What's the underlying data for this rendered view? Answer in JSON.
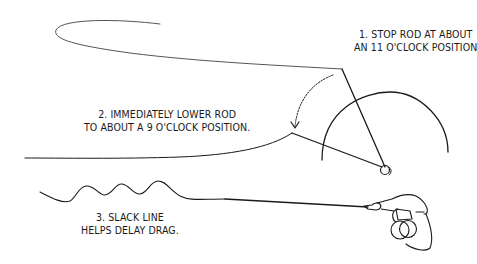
{
  "diagram": {
    "colors": {
      "ink": "#1a1a1a",
      "background": "#ffffff"
    },
    "steps": [
      {
        "number": "1.",
        "lines": [
          "1. STOP ROD AT ABOUT",
          "AN 11 O'CLOCK POSITION"
        ]
      },
      {
        "number": "2.",
        "lines": [
          "2. IMMEDIATELY LOWER ROD",
          "TO ABOUT A 9 O'CLOCK POSITION."
        ]
      },
      {
        "number": "3.",
        "lines": [
          "3. SLACK LINE",
          "HELPS DELAY DRAG."
        ]
      }
    ],
    "figures": [
      "loop-of-fly-line",
      "rod-at-11-oclock",
      "rod-at-9-oclock",
      "clock-arc",
      "dotted-lowering-arrow",
      "reel",
      "slack-wavy-line",
      "hand-holding-rod"
    ]
  }
}
